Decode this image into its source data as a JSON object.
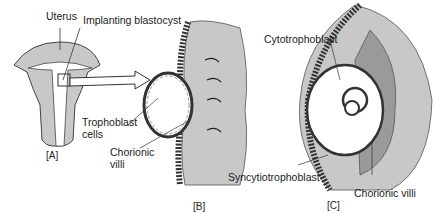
{
  "figure": {
    "panels": [
      {
        "id": "A",
        "caption": "[A]",
        "subject": "uterus with implanting blastocyst"
      },
      {
        "id": "B",
        "caption": "[B]",
        "subject": "blastocyst attaching to endometrium"
      },
      {
        "id": "C",
        "caption": "[C]",
        "subject": "embedded blastocyst with chorionic villi"
      }
    ],
    "labels": {
      "uterus": "Uterus",
      "implanting_blastocyst": "Implanting blastocyst",
      "trophoblast_line1": "Trophoblast",
      "trophoblast_line2": "cells",
      "chorionic_b_line1": "Chorionic",
      "chorionic_b_line2": "villi",
      "cytotrophoblast": "Cytotrophoblast",
      "syncytiotrophoblast": "Syncytiotrophoblast",
      "chorionic_c": "Chorionic villi"
    },
    "colors": {
      "tissue_gray": "#c8c8c8",
      "dark_tissue": "#9a9a9a",
      "line": "#333333",
      "cavity": "#ffffff"
    }
  }
}
